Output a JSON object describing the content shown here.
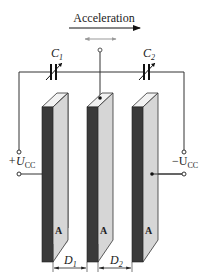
{
  "title": "Acceleration",
  "labels": {
    "acceleration": "Acceleration",
    "c1": "C",
    "c1_sub": "1",
    "c2": "C",
    "c2_sub": "2",
    "plus_ucc": "+U",
    "plus_ucc_sub": "CC",
    "minus_ucc": "−U",
    "minus_ucc_sub": "CC",
    "plate_a": "A",
    "d1": "D",
    "d1_sub": "1",
    "d2": "D",
    "d2_sub": "2"
  },
  "components": {
    "capacitors": [
      "C1",
      "C2"
    ],
    "plates": [
      "left-fixed-plate",
      "middle-movable-plate",
      "right-fixed-plate"
    ],
    "terminals": [
      "+UCC",
      "-UCC"
    ],
    "distances": [
      "D1",
      "D2"
    ]
  },
  "colors": {
    "plate_dark": "#3a3a3a",
    "plate_light": "#d4d4d4",
    "plate_top": "#f0f0f0",
    "wire": "#333333",
    "motion_arrow": "#999999"
  }
}
